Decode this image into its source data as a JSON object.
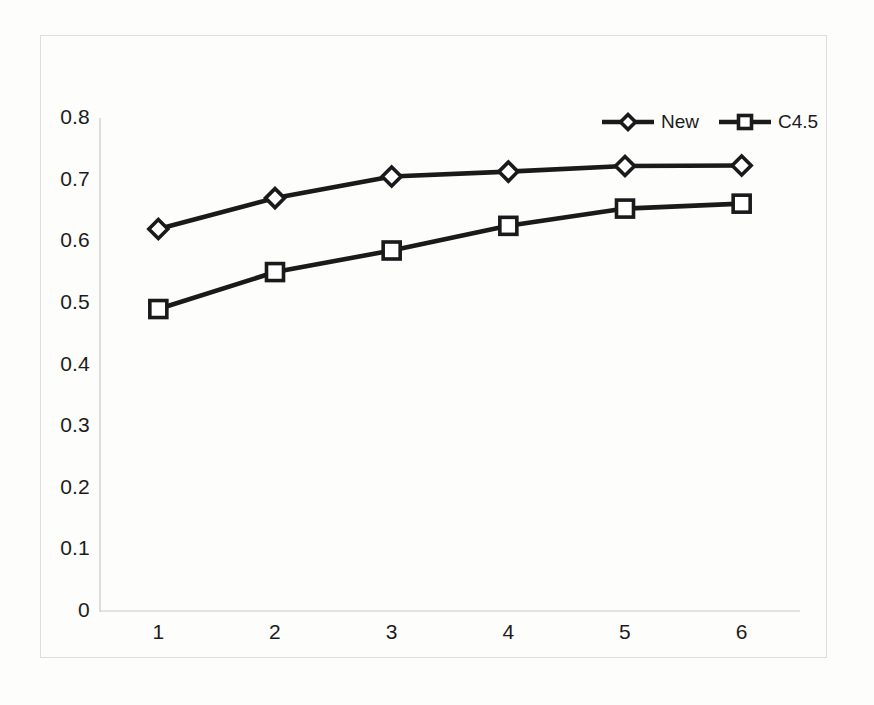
{
  "chart_data": {
    "type": "line",
    "title": "",
    "subtitle": "",
    "xlabel": "",
    "ylabel": "",
    "categories": [
      "1",
      "2",
      "3",
      "4",
      "5",
      "6"
    ],
    "x": [
      1,
      2,
      3,
      4,
      5,
      6
    ],
    "series": [
      {
        "name": "New",
        "marker": "diamond",
        "color": "#1a1a1a",
        "values": [
          0.62,
          0.67,
          0.705,
          0.713,
          0.722,
          0.723
        ]
      },
      {
        "name": "C4.5",
        "marker": "square",
        "color": "#1a1a1a",
        "values": [
          0.49,
          0.55,
          0.585,
          0.625,
          0.653,
          0.661
        ]
      }
    ],
    "ylim": [
      0,
      0.8
    ],
    "ytick_labels": [
      "0",
      "0.1",
      "0.2",
      "0.3",
      "0.4",
      "0.5",
      "0.6",
      "0.7",
      "0.8"
    ],
    "ytick_values": [
      0,
      0.1,
      0.2,
      0.3,
      0.4,
      0.5,
      0.6,
      0.7,
      0.8
    ],
    "xtick_labels": [
      "1",
      "2",
      "3",
      "4",
      "5",
      "6"
    ],
    "grid": false,
    "legend_position": "top-right",
    "legend_entries": [
      "New",
      "C4.5"
    ],
    "axis_color": "#c9c9c7",
    "line_color": "#1a1a1a",
    "marker_fill": "#ffffff",
    "background": "#fdfdfc"
  },
  "icons": {
    "diamond_marker": "diamond-marker-icon",
    "square_marker": "square-marker-icon"
  }
}
